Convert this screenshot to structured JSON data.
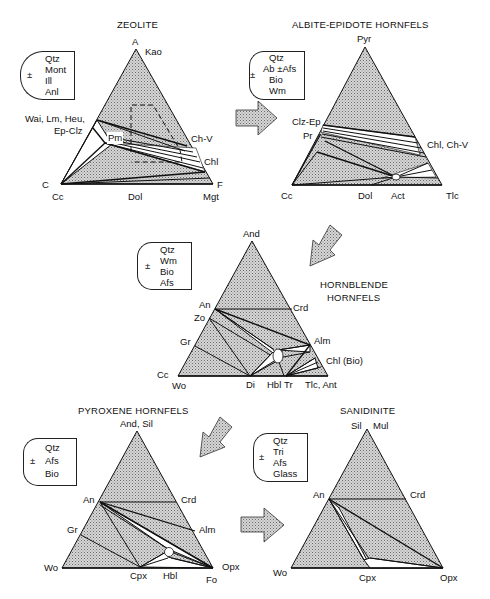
{
  "figure": {
    "arrow_fill": "#c8c8c8",
    "field_fill": "#c4c4c4",
    "line_color": "#111111"
  },
  "panels": {
    "zeolite": {
      "title": "ZEOLITE",
      "legend": {
        "sign": "±",
        "items": [
          "Qtz",
          "Mont",
          "Ill",
          "Anl"
        ]
      },
      "apex_labels": {
        "top_letter": "A",
        "top": "Kao",
        "left_letter": "C",
        "left": "Cc",
        "right_letter": "F",
        "right": "Mgt"
      },
      "side_labels": {
        "left1": "Wai, Lm, Heu,",
        "left2": "Ep-Clz",
        "inner": "Pm",
        "right1": "Ch-V",
        "right2": "Chl",
        "bottom": "Dol"
      }
    },
    "albite_epidote": {
      "title": "ALBITE-EPIDOTE  HORNFELS",
      "legend": {
        "sign": "±",
        "items": [
          "Qtz",
          "Ab ±Afs",
          "Bio",
          "Wm"
        ]
      },
      "apex_labels": {
        "top": "Pyr",
        "left": "Cc",
        "right": "Tlc"
      },
      "side_labels": {
        "left1": "Clz-Ep",
        "left2": "Pr",
        "right": "Chl, Ch-V",
        "bottom1": "Dol",
        "bottom2": "Act"
      }
    },
    "hornblende": {
      "title_line1": "HORNBLENDE",
      "title_line2": "HORNFELS",
      "legend": {
        "sign": "±",
        "items": [
          "Qtz",
          "Wm",
          "Bio",
          "Afs"
        ]
      },
      "apex_labels": {
        "top": "And",
        "left1": "Cc",
        "left2": "Wo",
        "right": "Tlc, Ant"
      },
      "side_labels": {
        "left1": "An",
        "left2": "Zo",
        "left3": "Gr",
        "right1": "Crd",
        "right2": "Alm",
        "right3": "Chl (Bio)",
        "bottom1": "Di",
        "bottom2": "Hbl",
        "bottom3": "Tr"
      }
    },
    "pyroxene": {
      "title": "PYROXENE  HORNFELS",
      "legend": {
        "sign": "±",
        "items": [
          "Qtz",
          "Afs",
          "Bio"
        ]
      },
      "apex_labels": {
        "top": "And, Sil",
        "left": "Wo",
        "right1": "Opx",
        "right2": "Fo"
      },
      "side_labels": {
        "left1": "An",
        "left2": "Gr",
        "right1": "Crd",
        "right2": "Alm",
        "bottom1": "Cpx",
        "bottom2": "Hbl"
      }
    },
    "sanidinite": {
      "title": "SANIDINITE",
      "legend": {
        "sign": "±",
        "items": [
          "Qtz",
          "Tri",
          "Afs",
          "Glass"
        ]
      },
      "apex_labels": {
        "top1": "Sil",
        "top2": "Mul",
        "left": "Wo",
        "right": "Opx"
      },
      "side_labels": {
        "left": "An",
        "right": "Crd",
        "bottom": "Cpx"
      }
    }
  }
}
